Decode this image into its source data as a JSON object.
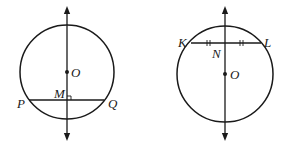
{
  "figures": [
    {
      "id": "left",
      "description": "Circle with center O; line through O perpendicular to chord PQ at M",
      "labels": {
        "center": "O",
        "foot": "M",
        "chord_left": "P",
        "chord_right": "Q"
      },
      "marks": [
        "right-angle at M"
      ]
    },
    {
      "id": "right",
      "description": "Circle with center O; line through O bisects chord KL at N",
      "labels": {
        "center": "O",
        "midpoint": "N",
        "chord_left": "K",
        "chord_right": "L"
      },
      "marks": [
        "double tick on KN",
        "double tick on NL"
      ]
    }
  ],
  "colors": {
    "stroke": "#1a1a1a",
    "background": "#ffffff"
  }
}
